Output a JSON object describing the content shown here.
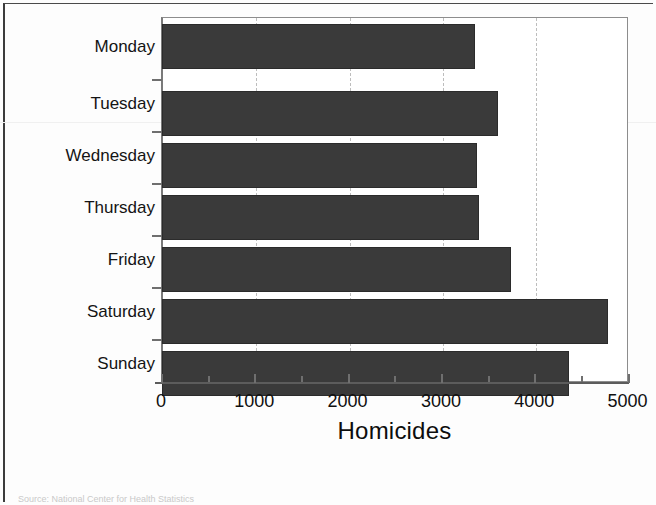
{
  "chart_data": {
    "type": "bar",
    "orientation": "horizontal",
    "title": "",
    "xlabel": "Homicides",
    "ylabel": "",
    "categories": [
      "Monday",
      "Tuesday",
      "Wednesday",
      "Thursday",
      "Friday",
      "Saturday",
      "Sunday"
    ],
    "values": [
      3360,
      3600,
      3380,
      3400,
      3740,
      4790,
      4370
    ],
    "xlim": [
      0,
      5000
    ],
    "xticks": [
      0,
      1000,
      2000,
      3000,
      4000,
      5000
    ],
    "xtick_labels": [
      "0",
      "1000",
      "2000",
      "3000",
      "4000",
      "5000"
    ],
    "minor_tick_step": 500,
    "grid": "vertical-dashed-at-major-ticks",
    "legend": "none",
    "bar_color": "#3a3a3a",
    "plot_background": "#ffffff"
  },
  "axis": {
    "x_title": "Homicides",
    "tick_labels": [
      "0",
      "1000",
      "2000",
      "3000",
      "4000",
      "5000"
    ]
  },
  "category_labels": [
    "Monday",
    "Tuesday",
    "Wednesday",
    "Thursday",
    "Friday",
    "Saturday",
    "Sunday"
  ],
  "caption": {
    "source_text": "Source: National Center for Health Statistics"
  }
}
